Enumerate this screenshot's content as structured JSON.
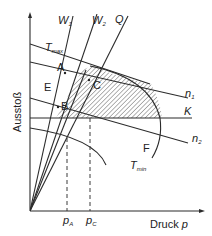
{
  "diagram": {
    "axes": {
      "y_label": "Ausstoß",
      "x_label": "Druck",
      "x_label_var": "p"
    },
    "lines": {
      "W1": {
        "label": "W",
        "sub": "1"
      },
      "W2": {
        "label": "W",
        "sub": "2"
      },
      "Q": {
        "label": "Q"
      },
      "Tmax": {
        "label": "T",
        "sub": "max"
      },
      "Tmin": {
        "label": "T",
        "sub": "min"
      },
      "n1": {
        "label": "n",
        "sub": "1"
      },
      "n2": {
        "label": "n",
        "sub": "2"
      },
      "K": {
        "label": "K"
      }
    },
    "points": {
      "A": "A",
      "B": "B",
      "C": "C"
    },
    "regions": {
      "E": "E",
      "F": "F"
    },
    "ticks": {
      "pA": {
        "label": "p",
        "sub": "A"
      },
      "pC": {
        "label": "p",
        "sub": "C"
      }
    },
    "colors": {
      "line": "#2b2b2b",
      "hatch": "#555555",
      "background": "#ffffff"
    }
  }
}
